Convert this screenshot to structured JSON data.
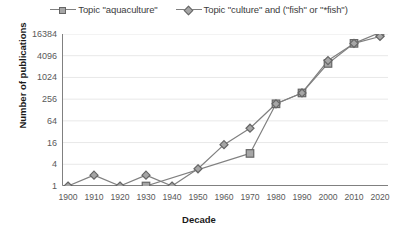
{
  "chart_data": {
    "type": "line",
    "title": "",
    "xlabel": "Decade",
    "ylabel": "Number of publications",
    "x": [
      1900,
      1910,
      1920,
      1930,
      1940,
      1950,
      1960,
      1970,
      1980,
      1990,
      2000,
      2010,
      2020
    ],
    "xticklabels": [
      "1900",
      "1910",
      "1920",
      "1930",
      "1940",
      "1950",
      "1960",
      "1970",
      "1980",
      "1990",
      "2000",
      "2010",
      "2020"
    ],
    "yticks": [
      1,
      4,
      16,
      64,
      256,
      1024,
      4096,
      16384
    ],
    "yticklabels": [
      "1",
      "4",
      "16",
      "64",
      "256",
      "1024",
      "4096",
      "16384"
    ],
    "yscale": "log4",
    "ylim": [
      1,
      16384
    ],
    "grid": true,
    "legend_position": "top-center",
    "series": [
      {
        "name": "Topic \"aquaculture\"",
        "marker": "square",
        "color": "#a6a6a6",
        "line_color": "#808080",
        "x": [
          1930,
          1970,
          1980,
          1990,
          2000,
          2010,
          2020
        ],
        "values": [
          1,
          8,
          190,
          380,
          2500,
          9000,
          18000
        ]
      },
      {
        "name": "Topic \"culture\" and (\"fish\" or \"*fish\")",
        "marker": "diamond",
        "color": "#a6a6a6",
        "line_color": "#808080",
        "x": [
          1900,
          1910,
          1920,
          1930,
          1940,
          1950,
          1960,
          1970,
          1980,
          1990,
          2000,
          2010,
          2020
        ],
        "values": [
          1,
          2,
          1,
          2,
          1,
          3,
          14,
          40,
          190,
          380,
          3000,
          9000,
          14000
        ]
      }
    ]
  },
  "legend": {
    "items": [
      {
        "label": "Topic \"aquaculture\"",
        "marker": "square"
      },
      {
        "label": "Topic \"culture\" and (\"fish\" or \"*fish\")",
        "marker": "diamond"
      }
    ]
  },
  "axes": {
    "y_title": "Number of publications",
    "x_title": "Decade"
  },
  "colors": {
    "marker_fill": "#a6a6a6",
    "marker_stroke": "#666666",
    "line": "#808080",
    "axis": "#808080",
    "grid": "#e8e8e8",
    "text": "#595959",
    "title_text": "#1a1a1a"
  }
}
